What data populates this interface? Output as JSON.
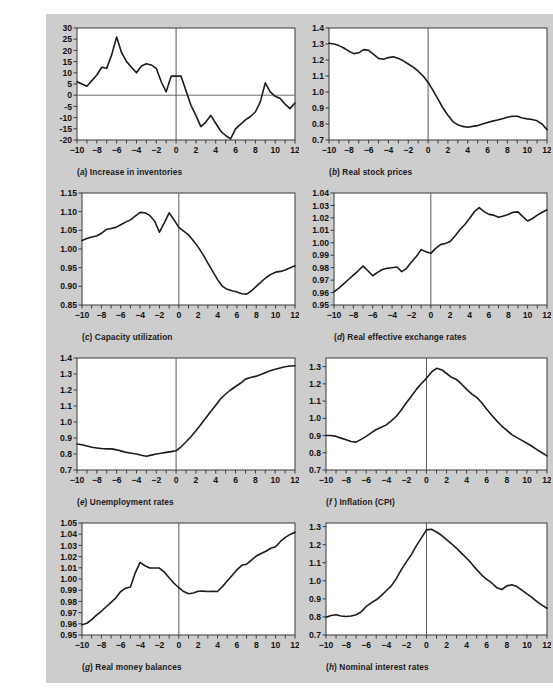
{
  "figure": {
    "background_color": "#cdcdcd",
    "plot_background": "#ffffff",
    "line_color": "#1c1c1c",
    "panel_count": 8
  },
  "chart_data": [
    {
      "type": "line",
      "panel": "a",
      "title": "Increase in inventories",
      "caption_label": "(a)",
      "xlabel": "",
      "ylabel": "",
      "xlim": [
        -10,
        12
      ],
      "ylim": [
        -20,
        30
      ],
      "xticks": [
        -10,
        -8,
        -6,
        -4,
        -2,
        0,
        2,
        4,
        6,
        8,
        10,
        12
      ],
      "yticks": [
        -20,
        -15,
        -10,
        -5,
        0,
        5,
        10,
        15,
        20,
        25,
        30
      ],
      "xticklabels": [
        "-10",
        "-8",
        "-6",
        "-4",
        "-2",
        "0",
        "2",
        "4",
        "6",
        "8",
        "10",
        "12"
      ],
      "yticklabels": [
        "-20",
        "-15",
        "-10",
        "-5",
        "0",
        "5",
        "10",
        "15",
        "20",
        "25",
        "30"
      ],
      "grid": false,
      "legend": null,
      "event_line_x": 0,
      "zero_line_y": 0,
      "x": [
        -10,
        -9.5,
        -9,
        -8.5,
        -8,
        -7.5,
        -7,
        -6.5,
        -6,
        -5.5,
        -5,
        -4.5,
        -4,
        -3.5,
        -3,
        -2.5,
        -2,
        -1.5,
        -1,
        -0.5,
        0,
        0.5,
        1,
        1.5,
        2,
        2.5,
        3,
        3.5,
        4,
        4.5,
        5,
        5.5,
        6,
        6.5,
        7,
        7.5,
        8,
        8.5,
        9,
        9.5,
        10,
        10.5,
        11,
        11.5,
        12
      ],
      "y": [
        6,
        5,
        4,
        6.5,
        9,
        12.5,
        12,
        18,
        26,
        19,
        15,
        12.5,
        10,
        13,
        14,
        13.5,
        12,
        6,
        1.5,
        8.5,
        8.5,
        8.5,
        2,
        -4.5,
        -9,
        -14,
        -12,
        -9,
        -12.5,
        -16,
        -18,
        -19.5,
        -15,
        -13,
        -11,
        -9.5,
        -7.5,
        -3,
        5.5,
        1.5,
        -0.5,
        -1.5,
        -4,
        -6,
        -3.5
      ]
    },
    {
      "type": "line",
      "panel": "b",
      "title": "Real stock prices",
      "caption_label": "(b)",
      "xlabel": "",
      "ylabel": "",
      "xlim": [
        -10,
        12
      ],
      "ylim": [
        0.7,
        1.4
      ],
      "xticks": [
        -10,
        -8,
        -6,
        -4,
        -2,
        0,
        2,
        4,
        6,
        8,
        10,
        12
      ],
      "yticks": [
        0.7,
        0.8,
        0.9,
        1.0,
        1.1,
        1.2,
        1.3,
        1.4
      ],
      "xticklabels": [
        "-10",
        "-8",
        "-6",
        "-4",
        "-2",
        "0",
        "2",
        "4",
        "6",
        "8",
        "10",
        "12"
      ],
      "yticklabels": [
        "0.7",
        "0.8",
        "0.9",
        "1.0",
        "1.1",
        "1.2",
        "1.3",
        "1.4"
      ],
      "grid": false,
      "legend": null,
      "event_line_x": 0,
      "zero_line_y": null,
      "x": [
        -10,
        -9.5,
        -9,
        -8.5,
        -8,
        -7.5,
        -7,
        -6.5,
        -6,
        -5.5,
        -5,
        -4.5,
        -4,
        -3.5,
        -3,
        -2.5,
        -2,
        -1.5,
        -1,
        -0.5,
        0,
        0.5,
        1,
        1.5,
        2,
        2.5,
        3,
        3.5,
        4,
        4.5,
        5,
        5.5,
        6,
        6.5,
        7,
        7.5,
        8,
        8.5,
        9,
        9.5,
        10,
        10.5,
        11,
        11.5,
        12
      ],
      "y": [
        1.305,
        1.3,
        1.29,
        1.275,
        1.255,
        1.24,
        1.245,
        1.265,
        1.26,
        1.235,
        1.21,
        1.205,
        1.215,
        1.22,
        1.21,
        1.195,
        1.175,
        1.155,
        1.13,
        1.1,
        1.06,
        1.01,
        0.955,
        0.9,
        0.855,
        0.815,
        0.795,
        0.785,
        0.78,
        0.785,
        0.79,
        0.8,
        0.81,
        0.818,
        0.825,
        0.833,
        0.842,
        0.848,
        0.848,
        0.838,
        0.832,
        0.828,
        0.82,
        0.8,
        0.765
      ]
    },
    {
      "type": "line",
      "panel": "c",
      "title": "Capacity utilization",
      "caption_label": "(c)",
      "xlabel": "",
      "ylabel": "",
      "xlim": [
        -10,
        12
      ],
      "ylim": [
        0.85,
        1.15
      ],
      "xticks": [
        -10,
        -8,
        -6,
        -4,
        -2,
        0,
        2,
        4,
        6,
        8,
        10,
        12
      ],
      "yticks": [
        0.85,
        0.9,
        0.95,
        1.0,
        1.05,
        1.1,
        1.15
      ],
      "xticklabels": [
        "-10",
        "-8",
        "-6",
        "-4",
        "-2",
        "0",
        "2",
        "4",
        "6",
        "8",
        "10",
        "12"
      ],
      "yticklabels": [
        "0.85",
        "0.90",
        "0.95",
        "1.00",
        "1.05",
        "1.10",
        "1.15"
      ],
      "grid": false,
      "legend": null,
      "event_line_x": 0,
      "zero_line_y": null,
      "x": [
        -10,
        -9.5,
        -9,
        -8.5,
        -8,
        -7.5,
        -7,
        -6.5,
        -6,
        -5.5,
        -5,
        -4.5,
        -4,
        -3.5,
        -3,
        -2.5,
        -2,
        -1.5,
        -1,
        -0.5,
        0,
        0.5,
        1,
        1.5,
        2,
        2.5,
        3,
        3.5,
        4,
        4.5,
        5,
        5.5,
        6,
        6.5,
        7,
        7.5,
        8,
        8.5,
        9,
        9.5,
        10,
        10.5,
        11,
        11.5,
        12
      ],
      "y": [
        1.023,
        1.028,
        1.032,
        1.035,
        1.042,
        1.052,
        1.055,
        1.058,
        1.065,
        1.072,
        1.078,
        1.088,
        1.098,
        1.097,
        1.09,
        1.075,
        1.045,
        1.07,
        1.097,
        1.078,
        1.058,
        1.048,
        1.038,
        1.022,
        1.005,
        0.985,
        0.962,
        0.94,
        0.918,
        0.9,
        0.892,
        0.888,
        0.885,
        0.88,
        0.879,
        0.888,
        0.9,
        0.912,
        0.923,
        0.932,
        0.938,
        0.94,
        0.944,
        0.95,
        0.955
      ]
    },
    {
      "type": "line",
      "panel": "d",
      "title": "Real effective exchange rates",
      "caption_label": "(d)",
      "xlabel": "",
      "ylabel": "",
      "xlim": [
        -10,
        12
      ],
      "ylim": [
        0.95,
        1.04
      ],
      "xticks": [
        -10,
        -8,
        -6,
        -4,
        -2,
        0,
        2,
        4,
        6,
        8,
        10,
        12
      ],
      "yticks": [
        0.95,
        0.96,
        0.97,
        0.98,
        0.99,
        1.0,
        1.01,
        1.02,
        1.03,
        1.04
      ],
      "xticklabels": [
        "-10",
        "-8",
        "-6",
        "-4",
        "-2",
        "0",
        "2",
        "4",
        "6",
        "8",
        "10",
        "12"
      ],
      "yticklabels": [
        "0.95",
        "0.96",
        "0.97",
        "0.98",
        "0.99",
        "1.00",
        "1.01",
        "1.02",
        "1.03",
        "1.04"
      ],
      "grid": false,
      "legend": null,
      "event_line_x": 0,
      "zero_line_y": null,
      "x": [
        -10,
        -9.5,
        -9,
        -8.5,
        -8,
        -7.5,
        -7,
        -6.5,
        -6,
        -5.5,
        -5,
        -4.5,
        -4,
        -3.5,
        -3,
        -2.5,
        -2,
        -1.5,
        -1,
        -0.5,
        0,
        0.5,
        1,
        1.5,
        2,
        2.5,
        3,
        3.5,
        4,
        4.5,
        5,
        5.5,
        6,
        6.5,
        7,
        7.5,
        8,
        8.5,
        9,
        9.5,
        10,
        10.5,
        11,
        11.5,
        12
      ],
      "y": [
        0.9605,
        0.9635,
        0.967,
        0.9705,
        0.974,
        0.9775,
        0.9812,
        0.9775,
        0.9735,
        0.9762,
        0.9785,
        0.9795,
        0.98,
        0.9805,
        0.9768,
        0.9795,
        0.9845,
        0.989,
        0.9945,
        0.9928,
        0.9915,
        0.9955,
        0.9985,
        0.9995,
        1.001,
        1.0055,
        1.0105,
        1.0145,
        1.0195,
        1.025,
        1.0282,
        1.025,
        1.0228,
        1.0222,
        1.0205,
        1.0215,
        1.0228,
        1.0245,
        1.0248,
        1.021,
        1.0175,
        1.0195,
        1.0222,
        1.0245,
        1.0265
      ]
    },
    {
      "type": "line",
      "panel": "e",
      "title": "Unemployment rates",
      "caption_label": "(e)",
      "xlabel": "",
      "ylabel": "",
      "xlim": [
        -10,
        12
      ],
      "ylim": [
        0.7,
        1.4
      ],
      "xticks": [
        -10,
        -8,
        -6,
        -4,
        -2,
        0,
        2,
        4,
        6,
        8,
        10,
        12
      ],
      "yticks": [
        0.7,
        0.8,
        0.9,
        1.0,
        1.1,
        1.2,
        1.3,
        1.4
      ],
      "xticklabels": [
        "-10",
        "-8",
        "-6",
        "-4",
        "-2",
        "0",
        "2",
        "4",
        "6",
        "8",
        "10",
        "12"
      ],
      "yticklabels": [
        "0.7",
        "0.8",
        "0.9",
        "1.0",
        "1.1",
        "1.2",
        "1.3",
        "1.4"
      ],
      "grid": false,
      "legend": null,
      "event_line_x": 0,
      "zero_line_y": null,
      "x": [
        -10,
        -9.5,
        -9,
        -8.5,
        -8,
        -7.5,
        -7,
        -6.5,
        -6,
        -5.5,
        -5,
        -4.5,
        -4,
        -3.5,
        -3,
        -2.5,
        -2,
        -1.5,
        -1,
        -0.5,
        0,
        0.5,
        1,
        1.5,
        2,
        2.5,
        3,
        3.5,
        4,
        4.5,
        5,
        5.5,
        6,
        6.5,
        7,
        7.5,
        8,
        8.5,
        9,
        9.5,
        10,
        10.5,
        11,
        11.5,
        12
      ],
      "y": [
        0.862,
        0.858,
        0.85,
        0.842,
        0.838,
        0.834,
        0.832,
        0.832,
        0.826,
        0.818,
        0.81,
        0.805,
        0.8,
        0.792,
        0.786,
        0.793,
        0.8,
        0.805,
        0.81,
        0.815,
        0.82,
        0.845,
        0.875,
        0.908,
        0.945,
        0.985,
        1.025,
        1.065,
        1.105,
        1.145,
        1.175,
        1.2,
        1.222,
        1.242,
        1.268,
        1.278,
        1.285,
        1.295,
        1.308,
        1.32,
        1.33,
        1.338,
        1.345,
        1.35,
        1.352
      ]
    },
    {
      "type": "line",
      "panel": "f",
      "title": "Inflation (CPI)",
      "caption_label": "(f )",
      "xlabel": "",
      "ylabel": "",
      "xlim": [
        -10,
        12
      ],
      "ylim": [
        0.7,
        1.35
      ],
      "xticks": [
        -10,
        -8,
        -6,
        -4,
        -2,
        0,
        2,
        4,
        6,
        8,
        10,
        12
      ],
      "yticks": [
        0.7,
        0.8,
        0.9,
        1.0,
        1.1,
        1.2,
        1.3
      ],
      "xticklabels": [
        "-10",
        "-8",
        "-6",
        "-4",
        "-2",
        "0",
        "2",
        "4",
        "6",
        "8",
        "10",
        "12"
      ],
      "yticklabels": [
        "0.7",
        "0.8",
        "0.9",
        "1.0",
        "1.1",
        "1.2",
        "1.3"
      ],
      "grid": false,
      "legend": null,
      "event_line_x": 0,
      "zero_line_y": null,
      "x": [
        -10,
        -9.5,
        -9,
        -8.5,
        -8,
        -7.5,
        -7,
        -6.5,
        -6,
        -5.5,
        -5,
        -4.5,
        -4,
        -3.5,
        -3,
        -2.5,
        -2,
        -1.5,
        -1,
        -0.5,
        0,
        0.5,
        1,
        1.5,
        2,
        2.5,
        3,
        3.5,
        4,
        4.5,
        5,
        5.5,
        6,
        6.5,
        7,
        7.5,
        8,
        8.5,
        9,
        9.5,
        10,
        10.5,
        11,
        11.5,
        12
      ],
      "y": [
        0.9,
        0.9,
        0.895,
        0.885,
        0.875,
        0.865,
        0.862,
        0.878,
        0.895,
        0.915,
        0.935,
        0.948,
        0.962,
        0.985,
        1.012,
        1.048,
        1.09,
        1.128,
        1.168,
        1.202,
        1.232,
        1.268,
        1.29,
        1.282,
        1.26,
        1.238,
        1.225,
        1.198,
        1.168,
        1.142,
        1.122,
        1.09,
        1.052,
        1.018,
        0.985,
        0.955,
        0.93,
        0.905,
        0.888,
        0.872,
        0.855,
        0.838,
        0.818,
        0.8,
        0.782
      ]
    },
    {
      "type": "line",
      "panel": "g",
      "title": "Real money balances",
      "caption_label": "(g)",
      "xlabel": "",
      "ylabel": "",
      "xlim": [
        -10,
        12
      ],
      "ylim": [
        0.95,
        1.05
      ],
      "xticks": [
        -10,
        -8,
        -6,
        -4,
        -2,
        0,
        2,
        4,
        6,
        8,
        10,
        12
      ],
      "yticks": [
        0.95,
        0.96,
        0.97,
        0.98,
        0.99,
        1.0,
        1.01,
        1.02,
        1.03,
        1.04,
        1.05
      ],
      "xticklabels": [
        "-10",
        "-8",
        "-6",
        "-4",
        "-2",
        "0",
        "2",
        "4",
        "6",
        "8",
        "10",
        "12"
      ],
      "yticklabels": [
        "0.95",
        "0.96",
        "0.97",
        "0.98",
        "0.99",
        "1.00",
        "1.01",
        "1.02",
        "1.03",
        "1.04",
        "1.05"
      ],
      "grid": false,
      "legend": null,
      "event_line_x": 0,
      "zero_line_y": null,
      "x": [
        -10,
        -9.5,
        -9,
        -8.5,
        -8,
        -7.5,
        -7,
        -6.5,
        -6,
        -5.5,
        -5,
        -4.5,
        -4,
        -3.5,
        -3,
        -2.5,
        -2,
        -1.5,
        -1,
        -0.5,
        0,
        0.5,
        1,
        1.5,
        2,
        2.5,
        3,
        3.5,
        4,
        4.5,
        5,
        5.5,
        6,
        6.5,
        7,
        7.5,
        8,
        8.5,
        9,
        9.5,
        10,
        10.5,
        11,
        11.5,
        12
      ],
      "y": [
        0.9592,
        0.9605,
        0.9638,
        0.9678,
        0.9712,
        0.9752,
        0.9792,
        0.9832,
        0.9888,
        0.9918,
        0.9928,
        1.0055,
        1.0148,
        1.0118,
        1.0098,
        1.0098,
        1.0098,
        1.0062,
        1.0012,
        0.9962,
        0.9922,
        0.9888,
        0.9868,
        0.9875,
        0.989,
        0.9892,
        0.9888,
        0.989,
        0.9888,
        0.9932,
        0.9982,
        1.0032,
        1.0082,
        1.0122,
        1.0132,
        1.0168,
        1.0205,
        1.0228,
        1.0248,
        1.0275,
        1.0288,
        1.0335,
        1.0372,
        1.0398,
        1.0418
      ]
    },
    {
      "type": "line",
      "panel": "h",
      "title": "Nominal interest rates",
      "caption_label": "(h)",
      "xlabel": "",
      "ylabel": "",
      "xlim": [
        -10,
        12
      ],
      "ylim": [
        0.7,
        1.32
      ],
      "xticks": [
        -10,
        -8,
        -6,
        -4,
        -2,
        0,
        2,
        4,
        6,
        8,
        10,
        12
      ],
      "yticks": [
        0.7,
        0.8,
        0.9,
        1.0,
        1.1,
        1.2,
        1.3
      ],
      "xticklabels": [
        "-10",
        "-8",
        "-6",
        "-4",
        "-2",
        "0",
        "2",
        "4",
        "6",
        "8",
        "10",
        "12"
      ],
      "yticklabels": [
        "0.7",
        "0.8",
        "0.9",
        "1.0",
        "1.1",
        "1.2",
        "1.3"
      ],
      "grid": false,
      "legend": null,
      "event_line_x": 0,
      "zero_line_y": null,
      "x": [
        -10,
        -9.5,
        -9,
        -8.5,
        -8,
        -7.5,
        -7,
        -6.5,
        -6,
        -5.5,
        -5,
        -4.5,
        -4,
        -3.5,
        -3,
        -2.5,
        -2,
        -1.5,
        -1,
        -0.5,
        0,
        0.5,
        1,
        1.5,
        2,
        2.5,
        3,
        3.5,
        4,
        4.5,
        5,
        5.5,
        6,
        6.5,
        7,
        7.5,
        8,
        8.5,
        9,
        9.5,
        10,
        10.5,
        11,
        11.5,
        12
      ],
      "y": [
        0.798,
        0.808,
        0.812,
        0.805,
        0.802,
        0.805,
        0.812,
        0.828,
        0.858,
        0.878,
        0.895,
        0.918,
        0.945,
        0.972,
        1.012,
        1.062,
        1.105,
        1.145,
        1.195,
        1.238,
        1.282,
        1.285,
        1.27,
        1.252,
        1.228,
        1.205,
        1.18,
        1.152,
        1.125,
        1.095,
        1.062,
        1.032,
        1.008,
        0.988,
        0.962,
        0.952,
        0.972,
        0.978,
        0.968,
        0.948,
        0.928,
        0.908,
        0.885,
        0.865,
        0.848
      ]
    }
  ]
}
